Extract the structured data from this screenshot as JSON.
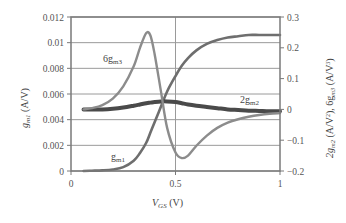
{
  "chart_data": {
    "type": "line",
    "title": "",
    "xlabel": "V_GS (V)",
    "ylabel_left": "g_m1 (A/V)",
    "ylabel_right": "2g_m2 (A/V^2), 6g_m3 (A/V^3)",
    "xlim": [
      0,
      1
    ],
    "ylim_left": [
      0,
      0.012
    ],
    "ylim_right": [
      -0.2,
      0.3
    ],
    "x_ticks": [
      "0",
      "0.5",
      "1"
    ],
    "y_ticks_left": [
      "0",
      "0.002",
      "0.004",
      "0.006",
      "0.008",
      "0.01",
      "0.012"
    ],
    "y_ticks_right": [
      "-0.2",
      "-0.1",
      "0",
      "0.1",
      "0.2",
      "0.3"
    ],
    "grid": true,
    "legend": "inline labels",
    "x": [
      0.06,
      0.1,
      0.15,
      0.2,
      0.25,
      0.3,
      0.33,
      0.36,
      0.38,
      0.4,
      0.43,
      0.46,
      0.5,
      0.53,
      0.56,
      0.6,
      0.65,
      0.7,
      0.75,
      0.8,
      0.85,
      0.9,
      0.95,
      1.0
    ],
    "series": [
      {
        "name": "g_m1",
        "axis": "left",
        "label": "gm1",
        "values": [
          0.0,
          2e-05,
          5e-05,
          0.00012,
          0.0003,
          0.0008,
          0.0014,
          0.0022,
          0.003,
          0.0038,
          0.005,
          0.0062,
          0.0074,
          0.0082,
          0.0088,
          0.0094,
          0.0099,
          0.0102,
          0.0104,
          0.0105,
          0.0106,
          0.0106,
          0.0106,
          0.0106
        ]
      },
      {
        "name": "2g_m2",
        "axis": "right",
        "label": "2gm2",
        "values": [
          0.0,
          0.0,
          0.0,
          0.002,
          0.006,
          0.012,
          0.016,
          0.02,
          0.022,
          0.024,
          0.026,
          0.026,
          0.024,
          0.02,
          0.016,
          0.012,
          0.008,
          0.004,
          0.0,
          -0.002,
          -0.004,
          -0.005,
          -0.006,
          -0.006
        ]
      },
      {
        "name": "6g_m3",
        "axis": "right",
        "label": "6gm3",
        "values": [
          0.0,
          0.004,
          0.014,
          0.035,
          0.075,
          0.14,
          0.2,
          0.248,
          0.24,
          0.18,
          0.06,
          -0.06,
          -0.14,
          -0.158,
          -0.15,
          -0.118,
          -0.085,
          -0.06,
          -0.043,
          -0.032,
          -0.024,
          -0.018,
          -0.014,
          -0.012
        ]
      }
    ],
    "annotations": [
      {
        "text": "6gm3",
        "x": 0.16,
        "y_right": 0.16
      },
      {
        "text": "2gm2",
        "x": 0.82,
        "y_right": 0.025
      },
      {
        "text": "gm1",
        "x": 0.2,
        "y_left": 0.0016
      }
    ]
  },
  "labels": {
    "xlabel_main": "V",
    "xlabel_sub": "GS",
    "xlabel_unit": " (V)",
    "ylabel_left_main": "g",
    "ylabel_left_sub": "m1",
    "ylabel_left_unit": " (A/V)",
    "ylabel_right_a": "2g",
    "ylabel_right_a_sub": "m2",
    "ylabel_right_a_unit": " (A/V",
    "ylabel_right_b": "), 6g",
    "ylabel_right_b_sub": "m3",
    "ylabel_right_b_unit": " (A/V",
    "ylabel_right_end": ")",
    "sup2": "2",
    "sup3": "3",
    "curve_gm1": "g",
    "curve_gm1_sub": "m1",
    "curve_gm2": "2g",
    "curve_gm2_sub": "m2",
    "curve_gm3": "6g",
    "curve_gm3_sub": "m3"
  },
  "colors": {
    "gm1": "#6e6e6e",
    "gm2": "#4a4a4a",
    "gm3": "#8c8c8c",
    "grid": "#9a9a9a",
    "axis": "#7a7a7a"
  }
}
